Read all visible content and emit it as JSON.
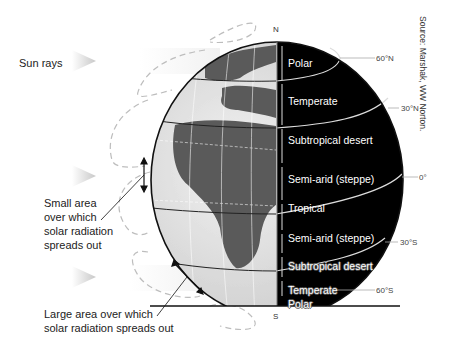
{
  "labels": {
    "sun_rays": "Sun rays",
    "small_area": [
      "Small area",
      "over which",
      "solar radiation",
      "spreads out"
    ],
    "large_area": [
      "Large area over which",
      "solar radiation spreads out"
    ],
    "north": "N",
    "south": "S",
    "source": "Source: Marshak, WW Norton."
  },
  "zones": [
    {
      "name": "Polar",
      "top": 55
    },
    {
      "name": "Temperate",
      "top": 93
    },
    {
      "name": "Subtropical desert",
      "top": 132
    },
    {
      "name": "Semi-arid (steppe)",
      "top": 173
    },
    {
      "name": "Tropical",
      "top": 202
    },
    {
      "name": "Semi-arid (steppe)",
      "top": 232
    },
    {
      "name": "Subtropical desert",
      "top": 260
    },
    {
      "name": "Temperate",
      "top": 286
    },
    {
      "name": "Polar",
      "top": 299
    }
  ],
  "latitudes": [
    {
      "label": "60°N",
      "top": 55
    },
    {
      "label": "30°N",
      "top": 105
    },
    {
      "label": "0°",
      "top": 174
    },
    {
      "label": "30°S",
      "top": 239
    },
    {
      "label": "60°S",
      "top": 286
    }
  ],
  "colors": {
    "night": "#000000",
    "land": "#555555",
    "ocean": "#d8d8d8",
    "arrows": "#bbbbbb"
  }
}
